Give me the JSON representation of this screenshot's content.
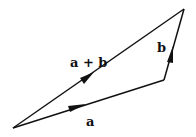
{
  "diagram": {
    "points": {
      "origin": [
        13,
        128
      ],
      "a_end": [
        164,
        80
      ],
      "apex": [
        184,
        9
      ]
    },
    "vectors": [
      {
        "id": "a",
        "label": "a",
        "from": "origin",
        "to": "a_end",
        "label_pos": [
          88,
          124
        ]
      },
      {
        "id": "b",
        "label": "b",
        "from": "a_end",
        "to": "apex",
        "label_pos": [
          158,
          52
        ]
      },
      {
        "id": "a_plus_b",
        "label": "a + b",
        "from": "origin",
        "to": "apex",
        "label_pos": [
          70,
          66
        ]
      }
    ],
    "stroke_color": "#111111"
  }
}
